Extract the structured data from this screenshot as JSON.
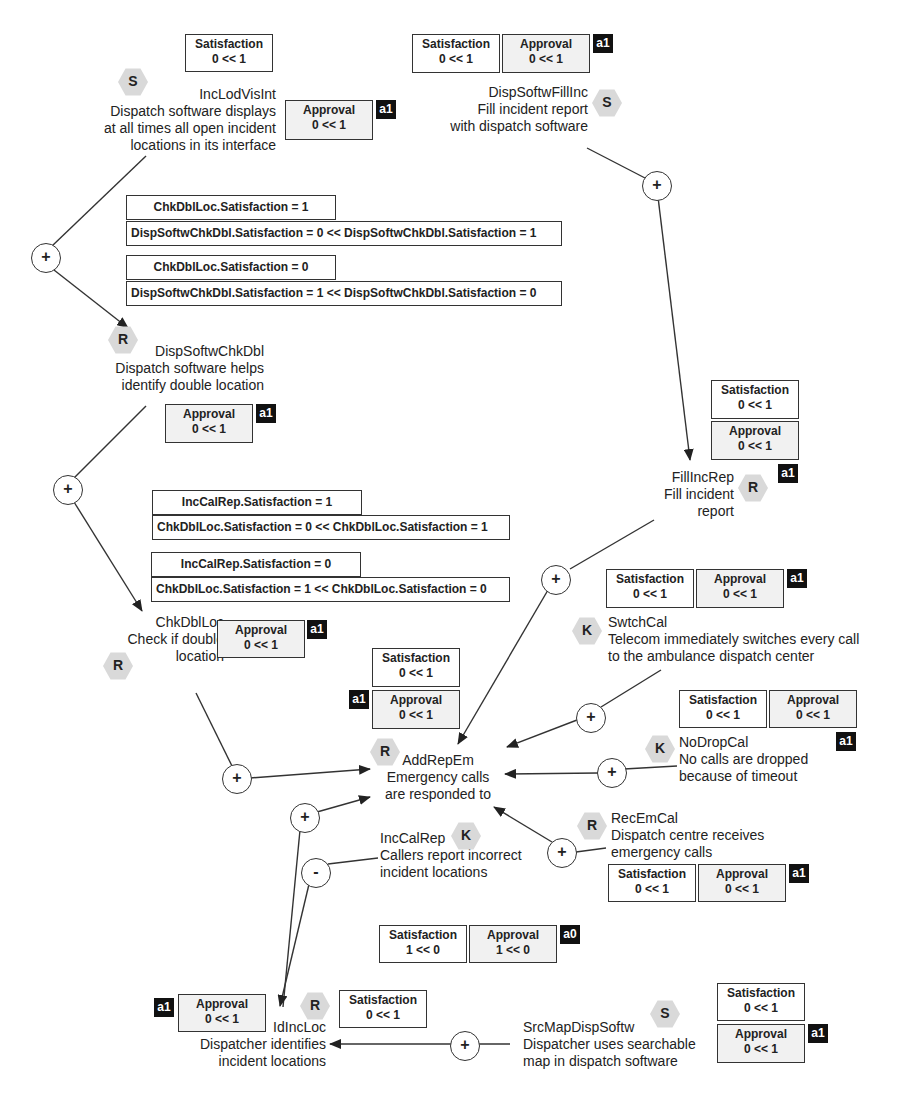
{
  "diagram": {
    "type": "goal-model",
    "nodes": {
      "IncLodVisInt": {
        "kind": "S",
        "id": "IncLodVisInt",
        "lines": [
          "Dispatch software displays",
          "at all times all open incident",
          "locations in its interface"
        ],
        "satisfaction": {
          "label": "Satisfaction",
          "value": "0 << 1"
        },
        "approval": {
          "label": "Approval",
          "value": "0 << 1"
        },
        "tag": "a1"
      },
      "DispSoftwFillInc": {
        "kind": "S",
        "id": "DispSoftwFillInc",
        "lines": [
          "Fill incident report",
          "with dispatch software"
        ],
        "satisfaction": {
          "label": "Satisfaction",
          "value": "0 << 1"
        },
        "approval": {
          "label": "Approval",
          "value": "0 << 1"
        },
        "tag": "a1"
      },
      "DispSoftwChkDbl": {
        "kind": "R",
        "id": "DispSoftwChkDbl",
        "lines": [
          "Dispatch software helps",
          "identify double location"
        ],
        "approval": {
          "label": "Approval",
          "value": "0 << 1"
        },
        "tag": "a1"
      },
      "FillIncRep": {
        "kind": "R",
        "id": "FillIncRep",
        "lines": [
          "Fill incident",
          "report"
        ],
        "satisfaction": {
          "label": "Satisfaction",
          "value": "0 << 1"
        },
        "approval": {
          "label": "Approval",
          "value": "0 << 1"
        },
        "tag": "a1"
      },
      "ChkDblLoc": {
        "kind": "R",
        "id": "ChkDblLoc",
        "lines": [
          "Check if double",
          "location"
        ],
        "approval": {
          "label": "Approval",
          "value": "0 << 1"
        },
        "tag": "a1"
      },
      "SwtchCal": {
        "kind": "K",
        "id": "SwtchCal",
        "lines": [
          "Telecom immediately switches every call",
          "to the ambulance dispatch center"
        ],
        "satisfaction": {
          "label": "Satisfaction",
          "value": "0 << 1"
        },
        "approval": {
          "label": "Approval",
          "value": "0 << 1"
        },
        "tag": "a1"
      },
      "AddRepEm": {
        "kind": "R",
        "id": "AddRepEm",
        "lines": [
          "Emergency calls",
          "are responded to"
        ],
        "satisfaction": {
          "label": "Satisfaction",
          "value": "0 << 1"
        },
        "approval": {
          "label": "Approval",
          "value": "0 << 1"
        },
        "tag": "a1"
      },
      "NoDropCal": {
        "kind": "K",
        "id": "NoDropCal",
        "lines": [
          "No calls are dropped",
          "because of timeout"
        ],
        "satisfaction": {
          "label": "Satisfaction",
          "value": "0 << 1"
        },
        "approval": {
          "label": "Approval",
          "value": "0 << 1"
        },
        "tag": "a1"
      },
      "RecEmCal": {
        "kind": "R",
        "id": "RecEmCal",
        "lines": [
          "Dispatch centre receives",
          "emergency calls"
        ],
        "satisfaction": {
          "label": "Satisfaction",
          "value": "0 << 1"
        },
        "approval": {
          "label": "Approval",
          "value": "0 << 1"
        },
        "tag": "a1"
      },
      "IncCalRep": {
        "kind": "K",
        "id": "IncCalRep",
        "lines": [
          "Callers report incorrect",
          "incident locations"
        ],
        "satisfaction": {
          "label": "Satisfaction",
          "value": "1 << 0"
        },
        "approval": {
          "label": "Approval",
          "value": "1 << 0"
        },
        "tag": "a0"
      },
      "IdIncLoc": {
        "kind": "R",
        "id": "IdIncLoc",
        "lines": [
          "Dispatcher identifies",
          "incident locations"
        ],
        "satisfaction": {
          "label": "Satisfaction",
          "value": "0 << 1"
        },
        "approval": {
          "label": "Approval",
          "value": "0 << 1"
        },
        "tag": "a1"
      },
      "SrcMapDispSoftw": {
        "kind": "S",
        "id": "SrcMapDispSoftw",
        "lines": [
          "Dispatcher uses searchable",
          "map in dispatch software"
        ],
        "satisfaction": {
          "label": "Satisfaction",
          "value": "0 << 1"
        },
        "approval": {
          "label": "Approval",
          "value": "0 << 1"
        },
        "tag": "a1"
      }
    },
    "conditions": {
      "chk1": {
        "head": "ChkDblLoc.Satisfaction = 1",
        "body": "DispSoftwChkDbl.Satisfaction = 0 << DispSoftwChkDbl.Satisfaction = 1"
      },
      "chk0": {
        "head": "ChkDblLoc.Satisfaction = 0",
        "body": "DispSoftwChkDbl.Satisfaction = 1 << DispSoftwChkDbl.Satisfaction = 0"
      },
      "inc1": {
        "head": "IncCalRep.Satisfaction = 1",
        "body": "ChkDblLoc.Satisfaction = 0 << ChkDblLoc.Satisfaction = 1"
      },
      "inc0": {
        "head": "IncCalRep.Satisfaction = 0",
        "body": "ChkDblLoc.Satisfaction = 1 << ChkDblLoc.Satisfaction = 0"
      }
    },
    "operators": {
      "plus": "+",
      "minus": "-"
    },
    "edges": [
      {
        "from": "IncLodVisInt",
        "to": "DispSoftwChkDbl",
        "op": "+"
      },
      {
        "from": "DispSoftwChkDbl",
        "to": "ChkDblLoc",
        "op": "+"
      },
      {
        "from": "DispSoftwFillInc",
        "to": "FillIncRep",
        "op": "+"
      },
      {
        "from": "FillIncRep",
        "to": "AddRepEm",
        "op": "+"
      },
      {
        "from": "ChkDblLoc",
        "to": "AddRepEm",
        "op": "+"
      },
      {
        "from": "SwtchCal",
        "to": "AddRepEm",
        "op": "+"
      },
      {
        "from": "NoDropCal",
        "to": "AddRepEm",
        "op": "+"
      },
      {
        "from": "RecEmCal",
        "to": "AddRepEm",
        "op": "+"
      },
      {
        "from": "IdIncLoc",
        "to": "AddRepEm",
        "op": "+"
      },
      {
        "from": "IncCalRep",
        "to": "IdIncLoc",
        "op": "-"
      },
      {
        "from": "SrcMapDispSoftw",
        "to": "IdIncLoc",
        "op": "+"
      }
    ]
  }
}
